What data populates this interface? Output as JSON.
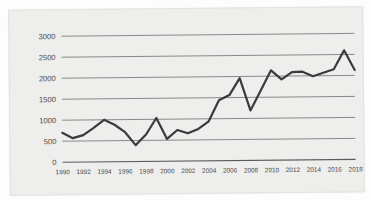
{
  "chart_data": {
    "type": "line",
    "title": "",
    "subtitle": "",
    "xlabel": "",
    "ylabel": "",
    "grid": true,
    "legend": false,
    "legend_position": "none",
    "line_color": "#3a3a3a",
    "background_color": "#eeeeec",
    "gridline_color": "#6f6f6f",
    "xlim": [
      1990,
      2018
    ],
    "ylim": [
      0,
      3000
    ],
    "y_ticks": [
      0,
      500,
      1000,
      1500,
      2000,
      2500,
      3000
    ],
    "y_tick_labels": [
      "0",
      "500",
      "1000",
      "1500",
      "2000",
      "2500",
      "3000"
    ],
    "x_ticks": [
      1990,
      1992,
      1994,
      1996,
      1998,
      2000,
      2002,
      2004,
      2006,
      2008,
      2010,
      2012,
      2014,
      2016,
      2018
    ],
    "x_tick_labels": [
      "1990",
      "1992",
      "1994",
      "1996",
      "1998",
      "2000",
      "2002",
      "2004",
      "2006",
      "2008",
      "2010",
      "2012",
      "2014",
      "2016",
      "2018"
    ],
    "x": [
      1990,
      1991,
      1992,
      1993,
      1994,
      1995,
      1996,
      1997,
      1998,
      1999,
      2000,
      2001,
      2002,
      2003,
      2004,
      2005,
      2006,
      2007,
      2008,
      2009,
      2010,
      2011,
      2012,
      2013,
      2014,
      2015,
      2016,
      2017,
      2018
    ],
    "values": [
      700,
      570,
      640,
      810,
      1000,
      880,
      700,
      390,
      640,
      1030,
      530,
      740,
      660,
      760,
      940,
      1440,
      1560,
      1960,
      1190,
      1660,
      2140,
      1920,
      2090,
      2100,
      1990,
      2070,
      2150,
      2600,
      2130
    ],
    "series": [
      {
        "name": "series-1",
        "values": [
          700,
          570,
          640,
          810,
          1000,
          880,
          700,
          390,
          640,
          1030,
          530,
          740,
          660,
          760,
          940,
          1440,
          1560,
          1960,
          1190,
          1660,
          2140,
          1920,
          2090,
          2100,
          1990,
          2070,
          2150,
          2600,
          2130
        ]
      }
    ],
    "annotations": []
  }
}
